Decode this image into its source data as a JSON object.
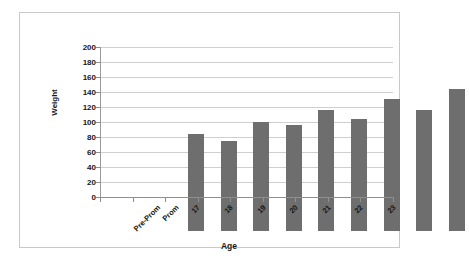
{
  "chart_data": {
    "type": "bar",
    "title": "",
    "xlabel": "Age",
    "ylabel": "Weight",
    "categories": [
      "Pre-Prom",
      "Prom",
      "17",
      "18",
      "19",
      "20",
      "21",
      "22",
      "23"
    ],
    "values": [
      130,
      120,
      145,
      141,
      161,
      150,
      176,
      161,
      190
    ],
    "ylim": [
      0,
      200
    ],
    "yticks": [
      0,
      20,
      40,
      60,
      80,
      100,
      120,
      140,
      160,
      180,
      200
    ],
    "ytick_labels": [
      "0",
      "20",
      "40",
      "60",
      "80",
      "100",
      "120",
      "140",
      "160",
      "180",
      "200"
    ],
    "grid": true,
    "legend": false,
    "bar_color": "#6e6e6e",
    "gridline_color": "#cfcfcf",
    "axis_color": "#8f8f8f",
    "frame_color": "#c9c9c9",
    "background": "#ffffff"
  }
}
